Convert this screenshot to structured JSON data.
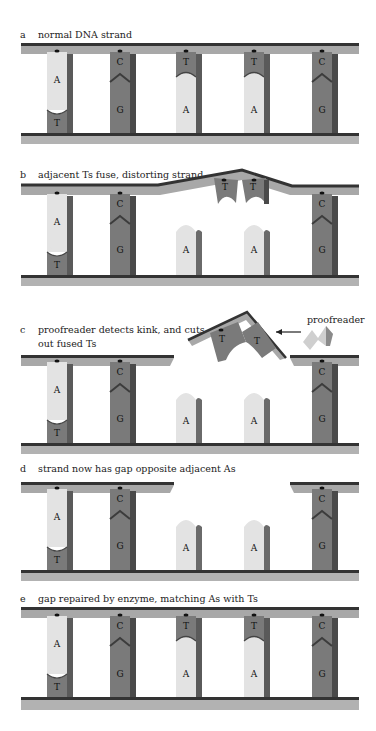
{
  "colors": {
    "strand_top": "#a9a9a9",
    "strand_dark": "#3a3a3a",
    "base_A": "#e2e2e2",
    "base_dark": "#7b7b7b",
    "base_shadow": "#4a4a4a"
  },
  "panels": [
    {
      "letter": "a",
      "caption": "normal DNA strand"
    },
    {
      "letter": "b",
      "caption": "adjacent Ts fuse, distorting strand"
    },
    {
      "letter": "c",
      "caption_line1": "proofreader detects kink, and cuts",
      "caption_line2": "out  fused Ts"
    },
    {
      "letter": "d",
      "caption": "strand now has gap opposite adjacent As"
    },
    {
      "letter": "e",
      "caption": "gap repaired by enzyme, matching As with Ts"
    }
  ],
  "proofreader_label": "proofreader",
  "bases": {
    "A": "A",
    "T": "T",
    "C": "C",
    "G": "G"
  }
}
